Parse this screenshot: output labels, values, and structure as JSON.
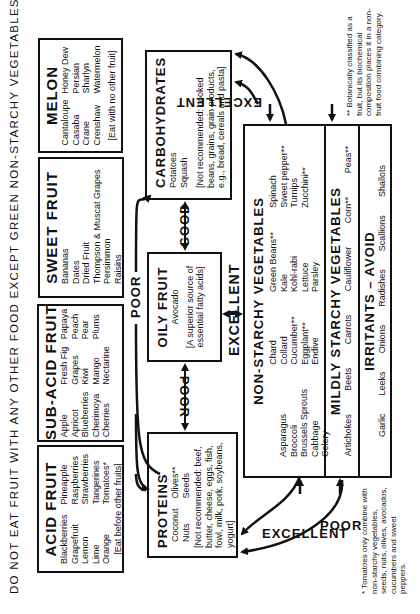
{
  "header": "DO NOT EAT FRUIT WITH ANY OTHER FOOD EXCEPT GREEN NON-STARCHY VEGETABLES",
  "acid_fruit": {
    "title": "ACID FRUIT",
    "col1": [
      "Blackberries",
      "Grapefruit",
      "Lemon",
      "Lime",
      "Orange"
    ],
    "col2": [
      "Pineapple",
      "Raspberries",
      "Strawberries",
      "Tangerines",
      "Tomatoes*"
    ],
    "note": "[Eat before other fruits]"
  },
  "sub_acid_fruit": {
    "title": "SUB-ACID FRUIT",
    "col1": [
      "Apple",
      "Apricot",
      "Blueberries",
      "Cherimoya",
      "Cherries"
    ],
    "col2": [
      "Fresh Fig",
      "Grapes",
      "Kiwi",
      "Mango",
      "Nectarine"
    ],
    "col3": [
      "Papaya",
      "Peach",
      "Pear",
      "Plums"
    ]
  },
  "sweet_fruit": {
    "title": "SWEET FRUIT",
    "items": [
      "Bananas",
      "Dates",
      "Dried Fruit",
      "Thompson & Muscat Grapes",
      "Persimmon",
      "Raisins"
    ]
  },
  "melon": {
    "title": "MELON",
    "col1": [
      "Cantaloupe",
      "Casaba",
      "Crane",
      "Crenshaw"
    ],
    "col2": [
      "Honey Dew",
      "Persian",
      "Sharlyn",
      "Watermelon"
    ],
    "note": "[Eat with no other fruit]"
  },
  "carbohydrates": {
    "title": "CARBOHYDRATES",
    "items": [
      "Potatoes",
      "Squash"
    ],
    "note": "[Not recommended: cooked beans, grains, grain products, e.g., bread, cereals and pasta]"
  },
  "oily_fruit": {
    "title": "OILY FRUIT",
    "items": [
      "Avocado"
    ],
    "note": "[A superior source of essential fatty acids]"
  },
  "proteins": {
    "title": "PROTEINS",
    "col1": [
      "Coconut",
      "Nuts"
    ],
    "col2": [
      "Olives**",
      "Seeds"
    ],
    "note": "[Not recommended: beef, butter, cheese, eggs, fish, fowl, milk, pork, soybeans, yogurt]"
  },
  "non_starchy": {
    "title": "NON-STARCHY VEGETABLES",
    "col1": [
      "Asparagus",
      "Broccoli",
      "Brussels Sprouts",
      "Cabbage",
      "Celery"
    ],
    "col2": [
      "Chard",
      "Collard",
      "Cucumber**",
      "Eggplant**",
      "Endive"
    ],
    "col3": [
      "Green Beans**",
      "Kale",
      "Kohl-rabi",
      "Lettuce",
      "Parsley"
    ],
    "col4": [
      "Spinach",
      "Sweet pepper**",
      "Turnips",
      "Zucchini**"
    ]
  },
  "mildly_starchy": {
    "title": "MILDLY STARCHY VEGETABLES",
    "items": [
      "Artichokes",
      "Beets",
      "Carrots",
      "Cauliflower",
      "Corn**",
      "Peas**"
    ]
  },
  "irritants": {
    "title": "IRRITANTS – AVOID",
    "items": [
      "Garlic",
      "Leeks",
      "Onions",
      "Radishes",
      "Scallions",
      "Shallots"
    ]
  },
  "labels": {
    "poor_top": "POOR",
    "good": "GOOD",
    "poor_mid": "POOR",
    "excellent_mid": "EXCELLENT",
    "excellent_right": "EXCELLENT",
    "excellent_left": "EXCELLENT",
    "poor_left": "POOR"
  },
  "footnotes": {
    "single": "* Tomatoes only combine with non-starchy vegetables, seeds, nuts, olives, avocados, cucumbers and sweet peppers.",
    "double": "** Botanically classified as a fruit, but its biochemical composition places it in a non-fruit food combining category."
  }
}
